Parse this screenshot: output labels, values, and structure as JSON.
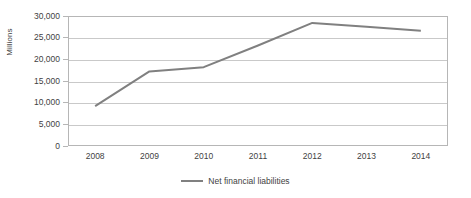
{
  "chart_data": {
    "type": "line",
    "title": "",
    "xlabel": "",
    "ylabel": "Millions",
    "categories": [
      "2008",
      "2009",
      "2010",
      "2011",
      "2012",
      "2013",
      "2014"
    ],
    "x": [
      2008,
      2009,
      2010,
      2011,
      2012,
      2013,
      2014
    ],
    "series": [
      {
        "name": "Net financial liabilities",
        "color": "#808080",
        "values": [
          9200,
          17200,
          18200,
          23200,
          28400,
          27500,
          26600
        ]
      }
    ],
    "ylim": [
      0,
      30000
    ],
    "y_ticks": [
      0,
      5000,
      10000,
      15000,
      20000,
      25000,
      30000
    ],
    "y_tick_labels": [
      "0",
      "5,000",
      "10,000",
      "15,000",
      "20,000",
      "25,000",
      "30,000"
    ],
    "grid": true,
    "legend_position": "bottom",
    "legend": [
      {
        "label": "Net financial liabilities",
        "color": "#808080"
      }
    ]
  },
  "axes": {
    "y_title": "Millions"
  },
  "colors": {
    "series_line": "#808080",
    "gridline": "#c9c9c9",
    "frame": "#b6b6b6",
    "text": "#3f3f3f",
    "background": "#ffffff"
  }
}
